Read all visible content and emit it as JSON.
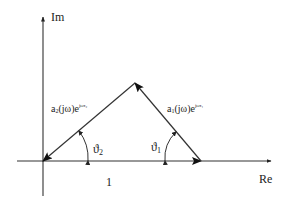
{
  "diagram": {
    "type": "complex-plane-vector-diagram",
    "axes": {
      "imaginary_label": "Im",
      "real_label": "Re"
    },
    "unit_label": "1",
    "vectors": [
      {
        "id": "vector-1",
        "label_base": "a",
        "label_sub": "1",
        "label_mid": "(jω)e",
        "label_sup": "jωτ₁",
        "from": "real-axis-point-1",
        "to": "apex"
      },
      {
        "id": "vector-2",
        "label_base": "a",
        "label_sub": "2",
        "label_mid": "(jω)e",
        "label_sup": "jωτ₂",
        "from": "apex",
        "to": "origin"
      },
      {
        "id": "unit-vector",
        "label": "1",
        "from": "origin",
        "to": "real-axis-point-1"
      }
    ],
    "angles": [
      {
        "id": "theta-1",
        "symbol": "ϑ",
        "sub": "1"
      },
      {
        "id": "theta-2",
        "symbol": "ϑ",
        "sub": "2"
      }
    ],
    "colors": {
      "stroke": "#222222",
      "background": "#ffffff"
    }
  }
}
